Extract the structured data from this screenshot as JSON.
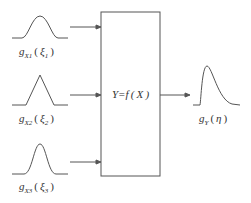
{
  "diagram": {
    "title": "",
    "system_box": {
      "label": "Y=f ( X )"
    },
    "inputs": [
      {
        "shape": "gaussian",
        "func": "g",
        "sub": "X1",
        "arg": "ξ",
        "arg_sub": "1"
      },
      {
        "shape": "triangular",
        "func": "g",
        "sub": "X2",
        "arg": "ξ",
        "arg_sub": "2"
      },
      {
        "shape": "gaussian-narrow",
        "func": "g",
        "sub": "X3",
        "arg": "ξ",
        "arg_sub": "3"
      }
    ],
    "output": {
      "shape": "right-skewed",
      "func": "g",
      "sub": "Y",
      "arg": "η"
    },
    "colors": {
      "line": "#555555",
      "text": "#333333",
      "background": "#ffffff"
    }
  }
}
